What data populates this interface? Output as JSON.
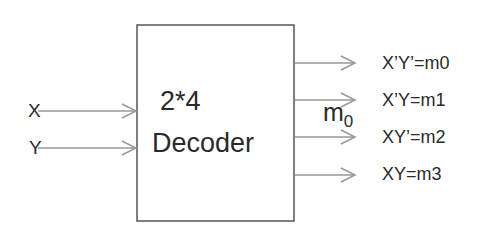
{
  "diagram": {
    "type": "2-to-4 decoder block diagram",
    "block": {
      "line1": "2*4",
      "line2": "Decoder"
    },
    "inputs": [
      {
        "label": "X"
      },
      {
        "label": "Y"
      }
    ],
    "outputs": [
      {
        "label": "X’Y’=m0"
      },
      {
        "label": "X’Y=m1"
      },
      {
        "label": "XY’=m2"
      },
      {
        "label": "XY=m3"
      }
    ],
    "annotation": {
      "base": "m",
      "subscript": "0"
    },
    "colors": {
      "box_border": "#555555",
      "arrow": "#999999",
      "text": "#2a2a2a"
    }
  }
}
